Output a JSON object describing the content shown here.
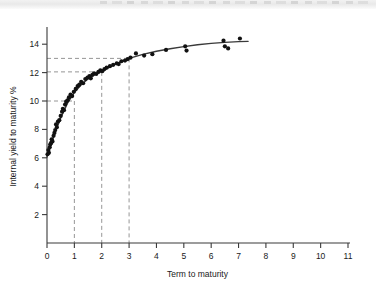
{
  "figure": {
    "background_color": "#ffffff",
    "axis_color": "#3a3a3a",
    "point_color": "#111111",
    "curve_color": "#3a3a3a",
    "guide_color": "#8a8a8a"
  },
  "chart_data": {
    "type": "scatter",
    "title": "",
    "subtitle": "",
    "xlabel": "Term to maturity",
    "ylabel": "Internal yield to maturity %",
    "xlim": [
      0,
      11
    ],
    "ylim": [
      0,
      15
    ],
    "xticks": [
      0,
      1,
      2,
      3,
      4,
      5,
      6,
      7,
      8,
      9,
      10,
      11
    ],
    "xtick_labels": [
      "0",
      "1",
      "2",
      "3",
      "4",
      "5",
      "6",
      "7",
      "8",
      "9",
      "10",
      "11"
    ],
    "yticks": [
      2,
      4,
      6,
      8,
      10,
      12,
      14
    ],
    "ytick_labels": [
      "2",
      "4",
      "6",
      "8",
      "10",
      "12",
      "14"
    ],
    "grid": false,
    "legend": null,
    "series": [
      {
        "name": "Bond observations",
        "marker": "filled-circle",
        "points": [
          [
            0.02,
            6.25
          ],
          [
            0.05,
            6.55
          ],
          [
            0.07,
            6.35
          ],
          [
            0.1,
            6.75
          ],
          [
            0.12,
            6.95
          ],
          [
            0.15,
            7.05
          ],
          [
            0.17,
            7.3
          ],
          [
            0.2,
            7.15
          ],
          [
            0.24,
            7.55
          ],
          [
            0.27,
            7.75
          ],
          [
            0.3,
            7.95
          ],
          [
            0.33,
            8.35
          ],
          [
            0.36,
            8.15
          ],
          [
            0.4,
            8.55
          ],
          [
            0.45,
            8.65
          ],
          [
            0.5,
            8.95
          ],
          [
            0.55,
            9.25
          ],
          [
            0.58,
            9.45
          ],
          [
            0.62,
            9.35
          ],
          [
            0.66,
            9.75
          ],
          [
            0.7,
            9.95
          ],
          [
            0.75,
            10.05
          ],
          [
            0.8,
            10.25
          ],
          [
            0.86,
            10.45
          ],
          [
            0.92,
            10.35
          ],
          [
            0.98,
            10.65
          ],
          [
            1.05,
            10.85
          ],
          [
            1.12,
            11.05
          ],
          [
            1.18,
            11.15
          ],
          [
            1.25,
            11.35
          ],
          [
            1.32,
            11.25
          ],
          [
            1.4,
            11.55
          ],
          [
            1.48,
            11.65
          ],
          [
            1.55,
            11.75
          ],
          [
            1.6,
            11.6
          ],
          [
            1.66,
            11.85
          ],
          [
            1.72,
            11.95
          ],
          [
            1.8,
            11.9
          ],
          [
            1.88,
            12.05
          ],
          [
            1.95,
            12.15
          ],
          [
            2.02,
            12.1
          ],
          [
            2.1,
            12.25
          ],
          [
            2.18,
            12.35
          ],
          [
            2.3,
            12.45
          ],
          [
            2.42,
            12.55
          ],
          [
            2.55,
            12.65
          ],
          [
            2.62,
            12.6
          ],
          [
            2.72,
            12.8
          ],
          [
            2.85,
            12.85
          ],
          [
            2.95,
            12.95
          ],
          [
            3.05,
            13.05
          ],
          [
            3.25,
            13.35
          ],
          [
            3.55,
            13.2
          ],
          [
            3.85,
            13.3
          ],
          [
            4.35,
            13.6
          ],
          [
            5.05,
            13.85
          ],
          [
            5.1,
            13.55
          ],
          [
            6.45,
            14.25
          ],
          [
            6.5,
            13.85
          ],
          [
            6.62,
            13.7
          ],
          [
            7.05,
            14.4
          ]
        ]
      }
    ],
    "fit_curve": {
      "name": "Fitted yield curve",
      "description": "smooth concave curve rising from about 6% at term 0 to about 14.2% near term 7.3",
      "x_start": 0.0,
      "x_end": 7.35,
      "points": [
        [
          0.0,
          6.05
        ],
        [
          0.25,
          7.55
        ],
        [
          0.5,
          8.8
        ],
        [
          0.75,
          9.85
        ],
        [
          1.0,
          10.6
        ],
        [
          1.25,
          11.15
        ],
        [
          1.5,
          11.55
        ],
        [
          1.75,
          11.85
        ],
        [
          2.0,
          12.1
        ],
        [
          2.25,
          12.35
        ],
        [
          2.5,
          12.58
        ],
        [
          2.75,
          12.8
        ],
        [
          3.0,
          13.0
        ],
        [
          3.5,
          13.28
        ],
        [
          4.0,
          13.5
        ],
        [
          4.5,
          13.68
        ],
        [
          5.0,
          13.83
        ],
        [
          5.5,
          13.96
        ],
        [
          6.0,
          14.06
        ],
        [
          6.5,
          14.13
        ],
        [
          7.0,
          14.18
        ],
        [
          7.35,
          14.2
        ]
      ]
    },
    "annotations": [
      {
        "name": "guide-1yr",
        "type": "dashed-crosshair",
        "x": 1.0,
        "y": 10.0,
        "label": ""
      },
      {
        "name": "guide-2yr",
        "type": "dashed-crosshair",
        "x": 2.0,
        "y": 12.05,
        "label": ""
      },
      {
        "name": "guide-3yr",
        "type": "dashed-crosshair",
        "x": 3.0,
        "y": 13.0,
        "label": ""
      }
    ]
  }
}
